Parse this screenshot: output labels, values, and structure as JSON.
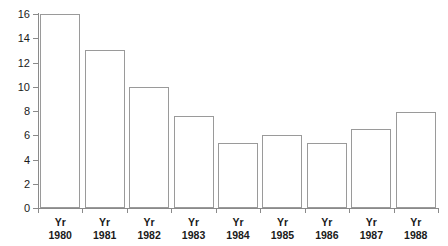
{
  "chart_data": {
    "type": "bar",
    "title": "",
    "subtitle": "",
    "xlabel": "",
    "ylabel": "",
    "categories": [
      "Yr 1980",
      "Yr 1981",
      "Yr 1982",
      "Yr 1983",
      "Yr 1984",
      "Yr 1985",
      "Yr 1986",
      "Yr 1987",
      "Yr 1988"
    ],
    "category_unit_labels": [
      "Yr",
      "Yr",
      "Yr",
      "Yr",
      "Yr",
      "Yr",
      "Yr",
      "Yr",
      "Yr"
    ],
    "category_year_labels": [
      "1980",
      "1981",
      "1982",
      "1983",
      "1984",
      "1985",
      "1986",
      "1987",
      "1988"
    ],
    "values": [
      16,
      13,
      10,
      7.6,
      5.4,
      6,
      5.4,
      6.5,
      7.9
    ],
    "ylim": [
      0,
      16
    ],
    "ytick_values": [
      0,
      2,
      4,
      6,
      8,
      10,
      12,
      14,
      16
    ],
    "ytick_labels": [
      "0",
      "2",
      "4",
      "6",
      "8",
      "10",
      "12",
      "14",
      "16"
    ],
    "grid": false,
    "legend": null,
    "legend_position": "none",
    "bar_fill_color": "#ffffff",
    "bar_edge_color": "#9a9a9a",
    "axis_color": "#8a8a8a",
    "background_color": "#ffffff",
    "text_color": "#1a1a1a"
  }
}
